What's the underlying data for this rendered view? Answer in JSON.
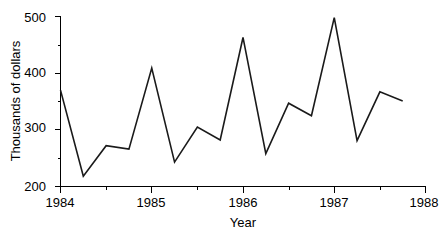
{
  "chart_data": {
    "type": "line",
    "title": "",
    "subtitle": "",
    "xlabel": "Year",
    "ylabel": "Thousands of dollars",
    "xlim": [
      1984,
      1988
    ],
    "ylim": [
      200,
      500
    ],
    "x_major_ticks": [
      1984,
      1985,
      1986,
      1987,
      1988
    ],
    "x_major_tick_labels": [
      "1984",
      "1985",
      "1986",
      "1987",
      "1988"
    ],
    "x_minor_ticks": [
      1984.5,
      1985.5,
      1986.5,
      1987.5
    ],
    "y_ticks": [
      200,
      300,
      400,
      500
    ],
    "y_tick_labels": [
      "200",
      "300",
      "400",
      "500"
    ],
    "y_minor_ticks": [
      250,
      350,
      450
    ],
    "grid": false,
    "legend": false,
    "legend_position": "none",
    "series": [
      {
        "name": "Sales",
        "x": [
          1984.0,
          1984.25,
          1984.5,
          1984.75,
          1985.0,
          1985.25,
          1985.5,
          1985.75,
          1986.0,
          1986.25,
          1986.5,
          1986.75,
          1987.0,
          1987.25,
          1987.5,
          1987.75
        ],
        "values": [
          370,
          218,
          272,
          266,
          409,
          243,
          305,
          282,
          463,
          258,
          347,
          325,
          498,
          281,
          367,
          351
        ]
      }
    ],
    "annotations": []
  },
  "axes": {
    "y_axis_label": "Thousands of dollars",
    "x_axis_label": "Year"
  },
  "colors": {
    "line": "#1a1a1a",
    "axis": "#000000",
    "background": "#ffffff",
    "text": "#000000"
  }
}
